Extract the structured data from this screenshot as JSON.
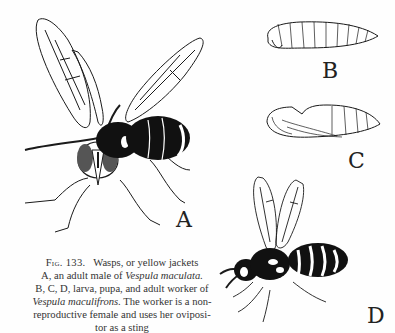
{
  "figure": {
    "number": "Fig. 133.",
    "title": "Wasps, or yellow jackets",
    "panels": [
      {
        "id": "A",
        "label": "A",
        "subject": "adult male wasp"
      },
      {
        "id": "B",
        "label": "B",
        "subject": "larva"
      },
      {
        "id": "C",
        "label": "C",
        "subject": "pupa"
      },
      {
        "id": "D",
        "label": "D",
        "subject": "adult worker wasp"
      }
    ],
    "caption": {
      "line1_prefix": "A, an adult male of ",
      "line1_species": "Vespula maculata.",
      "line2": "B, C, D, larva, pupa, and adult worker of",
      "line3_species": "Vespula maculifrons.",
      "line3_suffix": " The worker is a non-",
      "line4": "reproductive female and uses her oviposi-",
      "line5": "tor as a sting"
    }
  },
  "colors": {
    "ink": "#1a1a1a",
    "paper": "#fefefe"
  }
}
